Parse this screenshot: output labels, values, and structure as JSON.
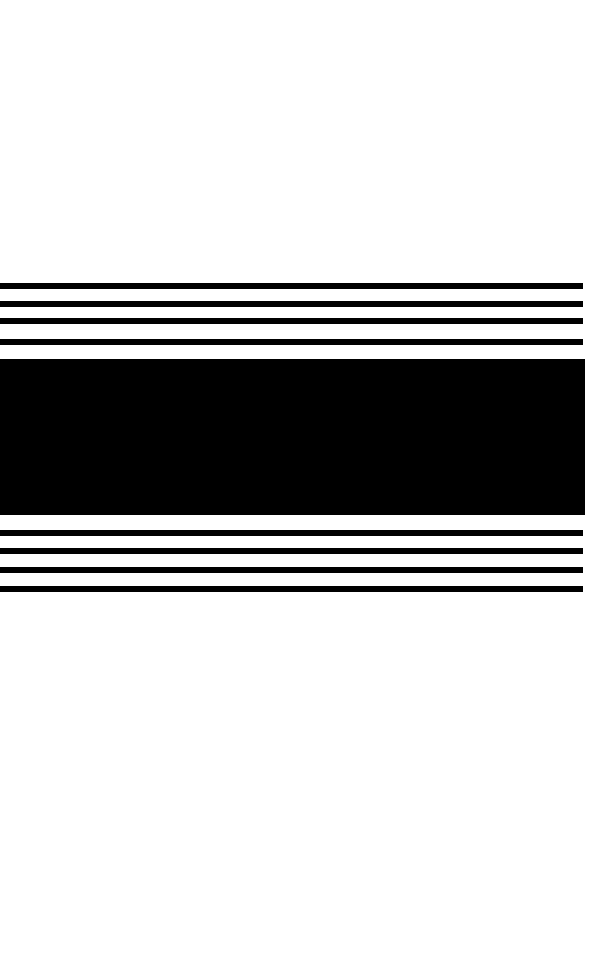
{
  "canvas": {
    "width": 590,
    "height": 979,
    "background_color": "#ffffff",
    "ink_color": "#000000"
  },
  "composition": {
    "title": "Horizontal Band Composition",
    "description": "White field with a centered horizontal arrangement of black bands: four thin rules above a solid block, and four thin rules below.",
    "orientation": "horizontal",
    "left_edge_x": 0,
    "right_edge_x": 583,
    "band_width": 583,
    "right_margin": 7
  },
  "bands": [
    {
      "id": "rule-top-1",
      "role": "thin-rule",
      "group": "upper",
      "index": 1,
      "y": 283,
      "height": 6,
      "x": 0,
      "width": 583,
      "color": "#000000"
    },
    {
      "id": "rule-top-2",
      "role": "thin-rule",
      "group": "upper",
      "index": 2,
      "y": 301,
      "height": 6,
      "x": 0,
      "width": 583,
      "color": "#000000"
    },
    {
      "id": "rule-top-3",
      "role": "thin-rule",
      "group": "upper",
      "index": 3,
      "y": 318,
      "height": 6,
      "x": 0,
      "width": 583,
      "color": "#000000"
    },
    {
      "id": "rule-top-4",
      "role": "thin-rule",
      "group": "upper",
      "index": 4,
      "y": 339,
      "height": 6,
      "x": 0,
      "width": 583,
      "color": "#000000"
    },
    {
      "id": "solid-block",
      "role": "solid-block",
      "group": "center",
      "index": 5,
      "y": 359,
      "height": 156,
      "x": 0,
      "width": 585,
      "color": "#000000"
    },
    {
      "id": "rule-bottom-1",
      "role": "thin-rule",
      "group": "lower",
      "index": 6,
      "y": 530,
      "height": 6,
      "x": 0,
      "width": 583,
      "color": "#000000"
    },
    {
      "id": "rule-bottom-2",
      "role": "thin-rule",
      "group": "lower",
      "index": 7,
      "y": 548,
      "height": 6,
      "x": 0,
      "width": 583,
      "color": "#000000"
    },
    {
      "id": "rule-bottom-3",
      "role": "thin-rule",
      "group": "lower",
      "index": 8,
      "y": 567,
      "height": 6,
      "x": 0,
      "width": 583,
      "color": "#000000"
    },
    {
      "id": "rule-bottom-4",
      "role": "thin-rule",
      "group": "lower",
      "index": 9,
      "y": 586,
      "height": 6,
      "x": 0,
      "width": 583,
      "color": "#000000"
    }
  ],
  "regions": {
    "top_whitespace": {
      "y": 0,
      "height": 283
    },
    "bottom_whitespace": {
      "y": 592,
      "height": 387
    }
  }
}
